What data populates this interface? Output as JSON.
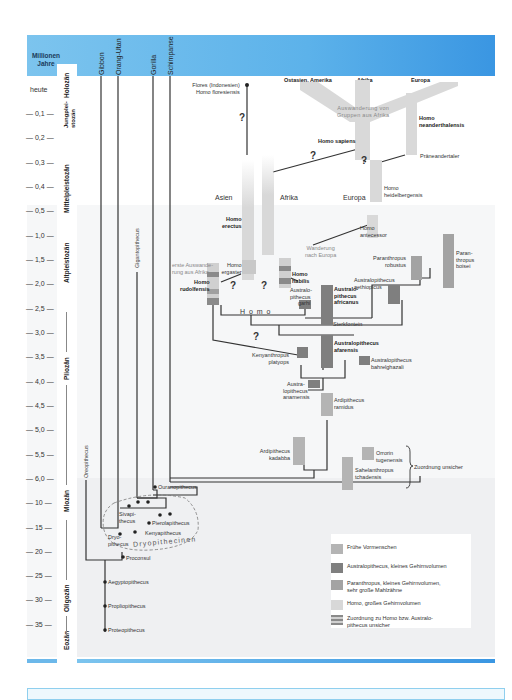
{
  "header": {
    "axis_title": "Millionen Jahre",
    "lineages": [
      "Gibbon",
      "Orang-Utan",
      "Gorilla",
      "Schimpanse"
    ],
    "regions_top": [
      "Ostasien, Amerika",
      "Afrika",
      "Europa"
    ],
    "color": "#5cb2ea"
  },
  "time_axis": {
    "ticks": [
      "heute",
      "0,1",
      "0,2",
      "0,3",
      "0,4",
      "0,5",
      "1,0",
      "1,5",
      "2,0",
      "2,5",
      "3,0",
      "3,5",
      "4,0",
      "4,5",
      "5,0",
      "5,5",
      "6,0",
      "10",
      "15",
      "20",
      "25",
      "30",
      "35"
    ],
    "epochs": [
      "Holozän",
      "Jungplei-stozän",
      "Mittelpleistozän",
      "Altpleistozän",
      "Pliozän",
      "Miozän",
      "Oligozän",
      "Eozän"
    ]
  },
  "species": {
    "flores": "Flores (Indonesien)",
    "floresiensis": "Homo floresiensis",
    "sapiens": "Homo sapiens",
    "neanderthalensis_1": "Homo",
    "neanderthalensis_2": "neanderthalensis",
    "praeneandertaler": "Präneandertaler",
    "heidelbergensis_1": "Homo",
    "heidelbergensis_2": "heidelbergensis",
    "antecessor_1": "Homo",
    "antecessor_2": "antecessor",
    "erectus_1": "Homo",
    "erectus_2": "erectus",
    "ergaster_1": "Homo",
    "ergaster_2": "ergaster",
    "rudolfensis_1": "Homo",
    "rudolfensis_2": "rudolfensis",
    "habilis_1": "Homo",
    "habilis_2": "habilis",
    "garhi_1": "Australo-",
    "garhi_2": "pithecus",
    "garhi_3": "garhi",
    "africanus_1": "Australo-",
    "africanus_2": "pithecus",
    "africanus_3": "africanus",
    "sterkfontein": "Sterkfontein",
    "aethiopicus_1": "Australopithecus",
    "aethiopicus_2": "aethiopicus",
    "robustus_1": "Paranthropus",
    "robustus_2": "robustus",
    "boisei_1": "Paran-",
    "boisei_2": "thropus",
    "boisei_3": "boisei",
    "afarensis_1": "Australopithecus",
    "afarensis_2": "afarensis",
    "bahrelghazali_1": "Australopithecus",
    "bahrelghazali_2": "bahrelghazali",
    "platyops_1": "Kenyanthropus",
    "platyops_2": "platyops",
    "anamensis_1": "Austra-",
    "anamensis_2": "lopithecus",
    "anamensis_3": "anamensis",
    "ramidus_1": "Ardipithecus",
    "ramidus_2": "ramidus",
    "kadabba_1": "Ardipithecus",
    "kadabba_2": "kadabba",
    "orrorin_1": "Orrorin",
    "orrorin_2": "tugenensis",
    "sahelanthropus_1": "Sahelanthropus",
    "sahelanthropus_2": "tchadensis",
    "zuordnung": "Zuordnung unsicher",
    "gigantopithecus": "Gigantopithecus",
    "oreopithecus": "Oreopithecus",
    "ouranopithecus": "Ouranopithecus",
    "sivapithecus_1": "Sivapi-",
    "sivapithecus_2": "thecus",
    "pierolapithecus": "Pierolapithecus",
    "kenyapithecus": "Kenyapithecus",
    "dryopithecus_1": "Dryo-",
    "dryopithecus_2": "pithecus",
    "dryopithecinen": "Dryopithecinen",
    "proconsul": "Proconsul",
    "aegyptopithecus": "Aegyptopithecus",
    "propliopithecus": "Propliopithecus",
    "proteopithecus": "Proteopithecus"
  },
  "annotations": {
    "auswanderung_1": "Auswanderung von",
    "auswanderung_2": "Gruppen aus Afrika",
    "erste_1": "erste Auswande-",
    "erste_2": "rung aus Afrika",
    "wanderung_1": "Wanderung",
    "wanderung_2": "nach Europa",
    "asien": "Asien",
    "afrika": "Afrika",
    "europa": "Europa",
    "homo_genus": "H o m o",
    "question": "?"
  },
  "legend": {
    "items": [
      {
        "label": "Frühe Vormenschen",
        "color": "#b4b4b4"
      },
      {
        "label": "Australopithecus, kleines Gehirnvolumen",
        "color": "#7f7f7f"
      },
      {
        "label_1": "Paranthropus, kleines Gehirnvolumen,",
        "label_2": "sehr große Mahlzähne",
        "color": "#a3a3a3"
      },
      {
        "label": "Homo, großes Gehirnvolumen",
        "color": "#d8d8d8"
      },
      {
        "label_1": "Zuordnung zu Homo bzw. Australo-",
        "label_2": "pithecus unsicher",
        "color": "striped"
      }
    ]
  }
}
